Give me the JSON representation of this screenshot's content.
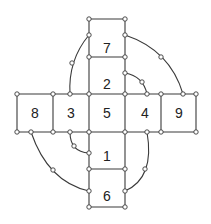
{
  "diagram": {
    "type": "cross-grid-with-arcs",
    "colors": {
      "stroke": "#3a3a3a",
      "node_fill": "#ffffff",
      "text": "#222222"
    },
    "cells": [
      {
        "label": "7",
        "x": 107,
        "y": 48
      },
      {
        "label": "2",
        "x": 107,
        "y": 84
      },
      {
        "label": "8",
        "x": 35,
        "y": 113
      },
      {
        "label": "3",
        "x": 71,
        "y": 113
      },
      {
        "label": "5",
        "x": 107,
        "y": 113
      },
      {
        "label": "4",
        "x": 145,
        "y": 113
      },
      {
        "label": "9",
        "x": 179,
        "y": 113
      },
      {
        "label": "1",
        "x": 107,
        "y": 156
      },
      {
        "label": "6",
        "x": 107,
        "y": 196
      }
    ],
    "lines": [
      [
        89,
        19,
        125,
        19
      ],
      [
        89,
        57,
        125,
        57
      ],
      [
        17,
        94,
        196,
        94
      ],
      [
        17,
        132,
        196,
        132
      ],
      [
        89,
        169,
        125,
        169
      ],
      [
        89,
        207,
        125,
        207
      ],
      [
        89,
        19,
        89,
        207
      ],
      [
        125,
        19,
        125,
        207
      ],
      [
        17,
        94,
        17,
        132
      ],
      [
        53,
        94,
        53,
        132
      ],
      [
        161,
        94,
        161,
        132
      ],
      [
        196,
        94,
        196,
        132
      ]
    ],
    "arcs": [
      {
        "name": "arc-top-right-outer",
        "path": "M125,35 Q170,50 183,94"
      },
      {
        "name": "arc-top-right-inner",
        "path": "M125,73 Q143,76 147,94"
      },
      {
        "name": "arc-top-left",
        "path": "M89,35 Q68,60 70,94"
      },
      {
        "name": "arc-bottom-left-outer",
        "path": "M31,132 Q48,182 89,191"
      },
      {
        "name": "arc-bottom-left-inner",
        "path": "M70,132 Q70,152 89,153"
      },
      {
        "name": "arc-bottom-right",
        "path": "M147,132 Q155,178 125,191"
      }
    ],
    "nodes": [
      [
        89,
        19
      ],
      [
        125,
        19
      ],
      [
        89,
        35
      ],
      [
        125,
        35
      ],
      [
        89,
        57
      ],
      [
        125,
        57
      ],
      [
        125,
        73
      ],
      [
        142,
        82
      ],
      [
        72,
        63
      ],
      [
        161,
        57
      ],
      [
        17,
        94
      ],
      [
        53,
        94
      ],
      [
        70,
        94
      ],
      [
        89,
        94
      ],
      [
        125,
        94
      ],
      [
        147,
        94
      ],
      [
        161,
        94
      ],
      [
        183,
        94
      ],
      [
        196,
        94
      ],
      [
        17,
        132
      ],
      [
        31,
        132
      ],
      [
        53,
        132
      ],
      [
        70,
        132
      ],
      [
        89,
        132
      ],
      [
        125,
        132
      ],
      [
        147,
        132
      ],
      [
        161,
        132
      ],
      [
        196,
        132
      ],
      [
        74,
        146
      ],
      [
        89,
        153
      ],
      [
        89,
        169
      ],
      [
        125,
        169
      ],
      [
        53,
        170
      ],
      [
        145,
        169
      ],
      [
        89,
        191
      ],
      [
        125,
        191
      ],
      [
        89,
        207
      ],
      [
        125,
        207
      ]
    ]
  }
}
